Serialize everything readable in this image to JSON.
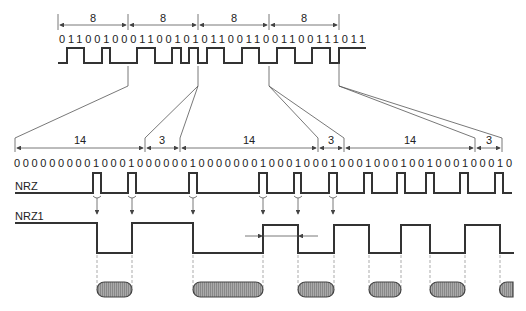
{
  "top": {
    "groups": [
      "8",
      "8",
      "8",
      "8"
    ],
    "bits": "01100100011001010110011001100111011"
  },
  "bottom": {
    "groups": [
      "14",
      "3",
      "14",
      "3",
      "14",
      "3"
    ],
    "bits": "000000000100010000001000000010001000100010001001000100010"
  },
  "signals": {
    "nrz_label": "NRZ",
    "nrz1_label": "NRZ1"
  }
}
